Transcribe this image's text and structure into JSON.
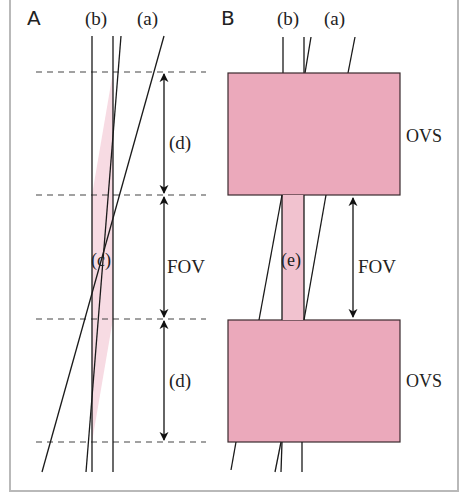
{
  "figure": {
    "panel_a": {
      "label": "A",
      "line_labels": {
        "b": "(b)",
        "a": "(a)"
      },
      "region_label": "(c)",
      "dimension_labels": {
        "top_gap": "(d)",
        "fov": "FOV",
        "bottom_gap": "(d)"
      }
    },
    "panel_b": {
      "label": "B",
      "line_labels": {
        "b": "(b)",
        "a": "(a)"
      },
      "region_label": "(e)",
      "dimension_labels": {
        "fov": "FOV"
      },
      "saturation_bands": [
        {
          "label": "OVS"
        },
        {
          "label": "OVS"
        }
      ]
    },
    "colors": {
      "pink_light": "#f7dbe3",
      "pink_band": "#ebb3c3",
      "ovs_fill": "#eba9bb",
      "stroke": "#1a1a1a",
      "dash": "#444444",
      "frame": "#b9b9b9"
    }
  }
}
